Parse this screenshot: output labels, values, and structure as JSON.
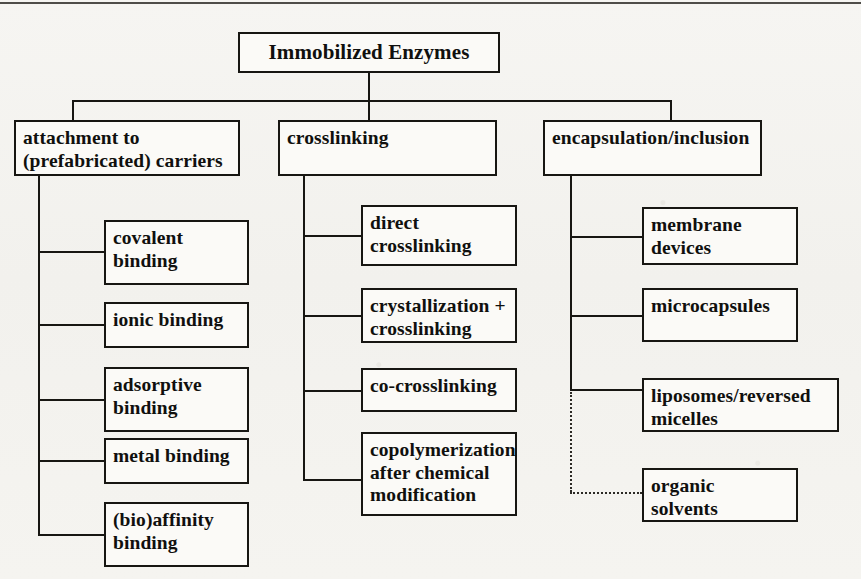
{
  "diagram": {
    "type": "tree",
    "title": "Immobilized Enzymes",
    "root": {
      "label": "Immobilized Enzymes"
    },
    "branches": [
      {
        "id": "attachment",
        "label": "attachment to\n(prefabricated) carriers",
        "children": [
          {
            "id": "covalent-binding",
            "label": "covalent\nbinding",
            "link": "solid"
          },
          {
            "id": "ionic-binding",
            "label": "ionic binding",
            "link": "solid"
          },
          {
            "id": "adsorptive-binding",
            "label": "adsorptive\nbinding",
            "link": "solid"
          },
          {
            "id": "metal-binding",
            "label": "metal binding",
            "link": "solid"
          },
          {
            "id": "bioaffinity-binding",
            "label": "(bio)affinity\nbinding",
            "link": "solid"
          }
        ]
      },
      {
        "id": "crosslinking",
        "label": "crosslinking",
        "children": [
          {
            "id": "direct-crosslinking",
            "label": "direct\ncrosslinking",
            "link": "solid"
          },
          {
            "id": "crystallization-crosslinking",
            "label": "crystallization +\ncrosslinking",
            "link": "solid"
          },
          {
            "id": "co-crosslinking",
            "label": "co-crosslinking",
            "link": "solid"
          },
          {
            "id": "copolymerization",
            "label": "copolymerization\nafter chemical\nmodification",
            "link": "solid"
          }
        ]
      },
      {
        "id": "encapsulation",
        "label": "encapsulation/inclusion",
        "children": [
          {
            "id": "membrane-devices",
            "label": "membrane\ndevices",
            "link": "solid"
          },
          {
            "id": "microcapsules",
            "label": "microcapsules",
            "link": "solid"
          },
          {
            "id": "liposomes-micelles",
            "label": "liposomes/reversed\nmicelles",
            "link": "solid"
          },
          {
            "id": "organic-solvents",
            "label": "organic\nsolvents",
            "link": "dotted"
          }
        ]
      }
    ],
    "colors": {
      "line": "#171612",
      "box_fill": "#fbfaf7",
      "text": "#10100e",
      "page_background": "#f4f3f0"
    }
  }
}
